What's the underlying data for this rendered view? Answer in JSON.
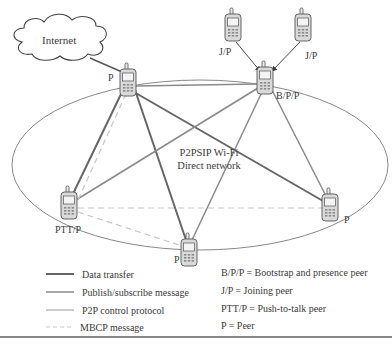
{
  "diagram": {
    "cloud_label": "Internet",
    "network_label_line1": "P2PSIP Wi-Fi",
    "network_label_line2": "Direct network",
    "nodes": [
      {
        "id": "p_top_left",
        "label": "P"
      },
      {
        "id": "bpp",
        "label": "B/P/P"
      },
      {
        "id": "jp_left",
        "label": "J/P"
      },
      {
        "id": "jp_right",
        "label": "J/P"
      },
      {
        "id": "ptt",
        "label": "PTT/P"
      },
      {
        "id": "p_bottom",
        "label": "P"
      },
      {
        "id": "p_right",
        "label": "P"
      }
    ],
    "colors": {
      "data_transfer": "#666666",
      "publish_subscribe": "#8a8a8a",
      "p2p_control": "#9a9a9a",
      "mbcp": "#c8c8c8",
      "ellipse": "#7a7a7a"
    }
  },
  "legend": {
    "lines": [
      {
        "label": "Data transfer",
        "style": "thick-dark"
      },
      {
        "label": "Publish/subscribe message",
        "style": "medium-gray"
      },
      {
        "label": "P2P control protocol",
        "style": "thin-gray"
      },
      {
        "label": "MBCP message",
        "style": "dashed-light"
      }
    ],
    "definitions": [
      "B/P/P = Bootstrap and presence peer",
      "J/P = Joining peer",
      "PTT/P = Push-to-talk peer",
      "P = Peer"
    ]
  }
}
